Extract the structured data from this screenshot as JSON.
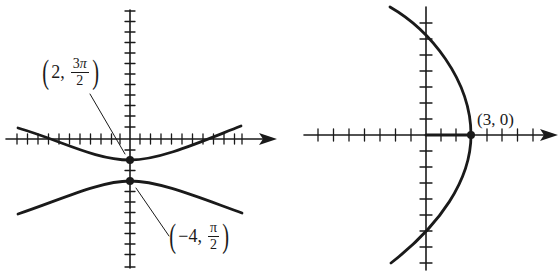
{
  "graphs": [
    {
      "id": "left",
      "description": "Hyperbola in polar coordinates with vertices marked",
      "axes": {
        "origin": [
          130,
          139
        ],
        "x_range_px": [
          5,
          277
        ],
        "y_range_px": [
          10,
          268
        ],
        "tick_spacing_px": 10.5
      },
      "points": [
        {
          "label_r": "2",
          "label_theta_num": "3π",
          "label_theta_num_coef": "3",
          "label_theta_den": "2",
          "px": [
            130,
            160
          ]
        },
        {
          "label_r": "−4",
          "label_theta_num": "π",
          "label_theta_den": "2",
          "px": [
            130,
            181
          ]
        }
      ]
    },
    {
      "id": "right",
      "description": "Parabola opening left in polar coordinates with vertex marked",
      "axes": {
        "origin": [
          426,
          135
        ],
        "x_range_px": [
          305,
          558
        ],
        "y_range_px": [
          7,
          270
        ],
        "tick_spacing_px": 15.5
      },
      "points": [
        {
          "label": "(3, 0)",
          "px": [
            471,
            135
          ]
        }
      ]
    }
  ],
  "labels": {
    "left_upper": {
      "open": "(",
      "r": "2,",
      "num_coef": "3",
      "num_sym": "π",
      "den": "2",
      "close": ")"
    },
    "left_lower": {
      "open": "(",
      "r": "−4,",
      "num_sym": "π",
      "den": "2",
      "close": ")"
    },
    "right_vertex": "(3, 0)"
  },
  "colors": {
    "ink": "#1a1a1a",
    "background": "#ffffff"
  }
}
